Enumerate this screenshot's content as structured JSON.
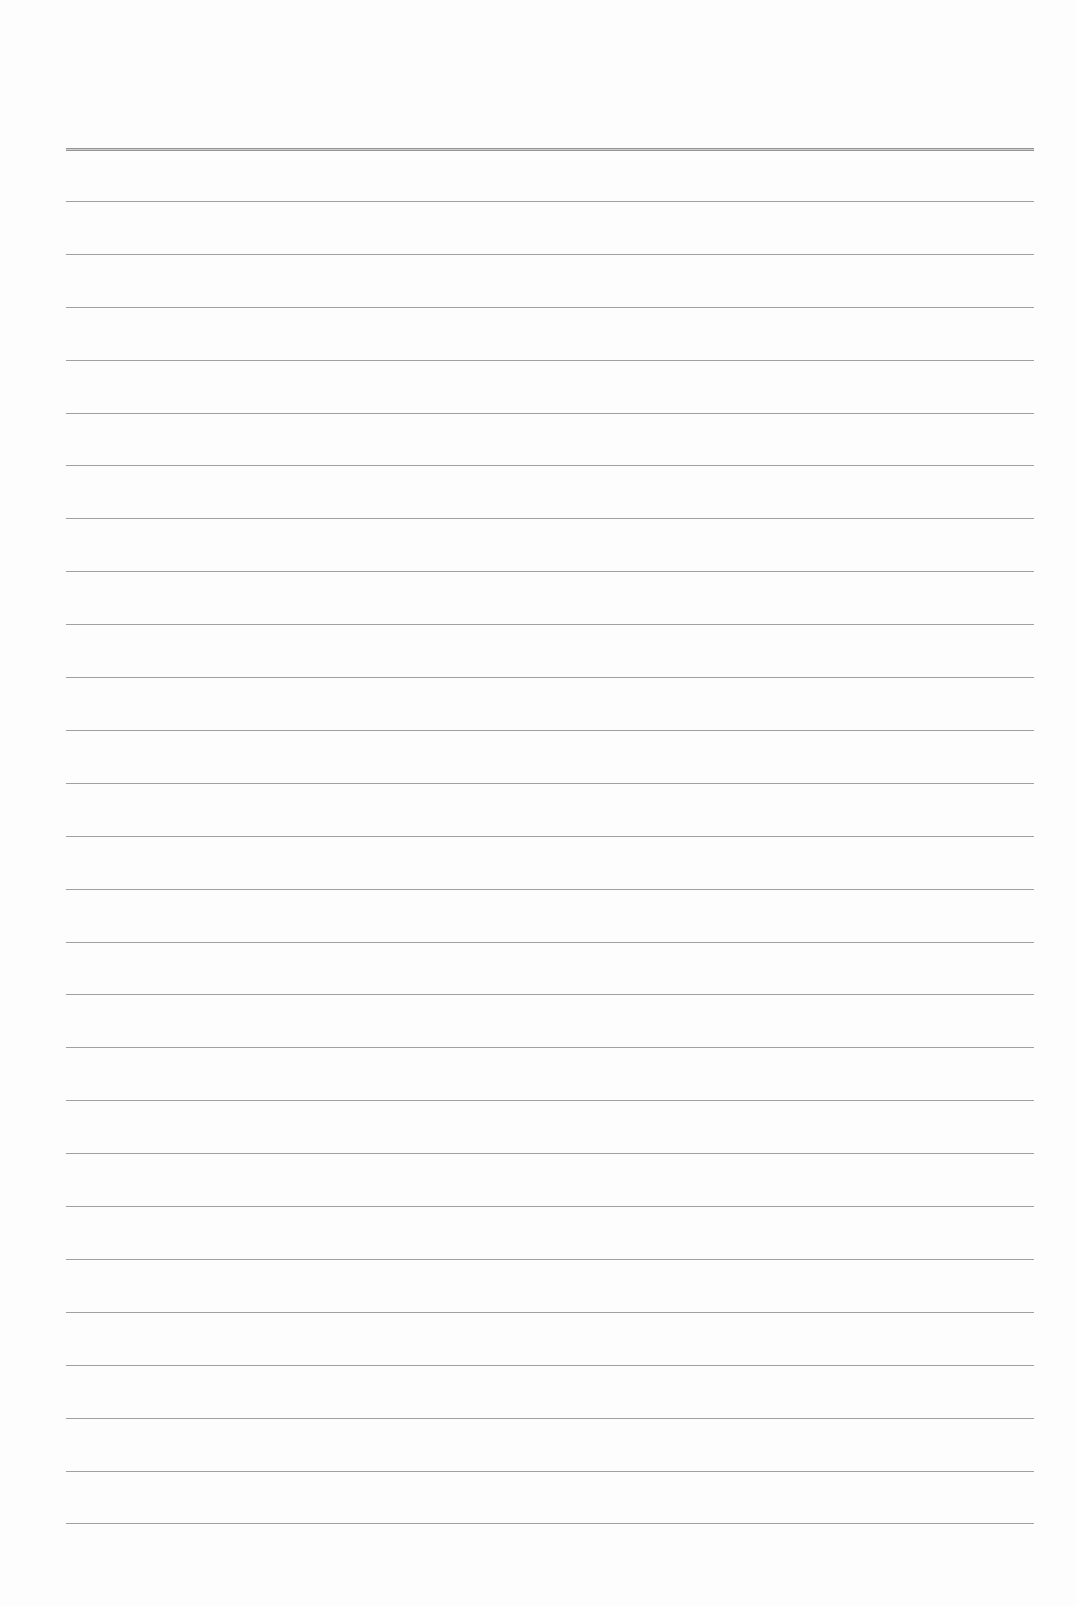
{
  "document": {
    "type": "lined-paper",
    "text_content": "",
    "colors": {
      "paper": "#fdfdfd",
      "rule_line": "#8f8f8f"
    },
    "rules": {
      "count": 27,
      "first_y": 148,
      "spacing": 52.9,
      "left_x": 66,
      "right_x": 1034,
      "header_rule_index": 0
    }
  }
}
